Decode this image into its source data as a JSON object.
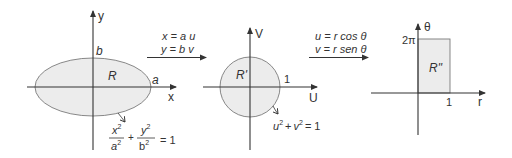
{
  "colors": {
    "stroke": "#333333",
    "region_fill": "#ececec",
    "region_stroke": "#7a7a7a"
  },
  "panel1": {
    "axis_x_label": "x",
    "axis_y_label": "y",
    "region_label": "R",
    "a_label": "a",
    "b_label": "b",
    "equation": {
      "num1": "x",
      "den1": "a",
      "num2": "y",
      "den2": "b",
      "sup": "2",
      "plus": "+",
      "rhs": "= 1"
    }
  },
  "transform1": {
    "line1": "x = a u",
    "line2": "y = b v"
  },
  "panel2": {
    "axis_x_label": "U",
    "axis_y_label": "V",
    "region_label": "R'",
    "radius_label": "1",
    "equation": {
      "u": "u",
      "v": "v",
      "sup": "2",
      "plus": "+",
      "rhs": "= 1"
    }
  },
  "transform2": {
    "line1": "u = r cos θ",
    "line2": "v = r sen θ"
  },
  "panel3": {
    "axis_x_label": "r",
    "axis_y_label": "θ",
    "region_label": "R\"",
    "top_label": "2π",
    "right_label": "1"
  }
}
